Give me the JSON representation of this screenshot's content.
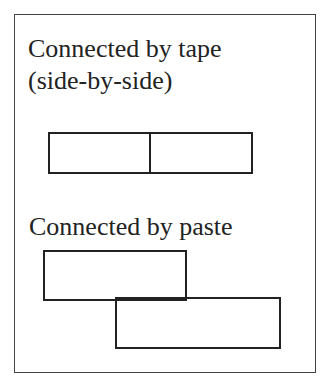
{
  "diagram": {
    "tape_label_line1": "Connected by tape",
    "tape_label_line2": "(side-by-side)",
    "paste_label": "Connected by paste",
    "stroke_color": "#222222",
    "frame_color": "#444444"
  }
}
